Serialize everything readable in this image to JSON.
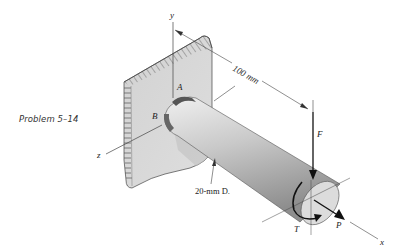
{
  "caption": "Problem 5–14",
  "labels": {
    "y_axis": "y",
    "z_axis": "z",
    "x_axis": "x",
    "point_a": "A",
    "point_b": "B",
    "force_f": "F",
    "torque_t": "T",
    "force_p": "P",
    "length_dim": "100 mm",
    "diameter_dim": "20-mm D."
  },
  "colors": {
    "wall_fill": "#d9d9d9",
    "hatch": "#555555",
    "shaft_light": "#e6e6e6",
    "shaft_dark": "#9a9a9a",
    "line": "#333333"
  }
}
